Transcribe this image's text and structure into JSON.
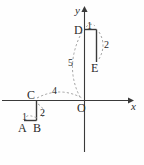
{
  "figure": {
    "kind": "coordinate-geometry-diagram",
    "background_color": "#fefefe",
    "stroke_color": "#3a3a3a",
    "dashed_color": "#8c8c8c",
    "axes": {
      "x_label": "x",
      "y_label": "y",
      "origin_label": "O",
      "origin_px": {
        "x": 84,
        "y": 100
      }
    },
    "points": [
      {
        "name": "A",
        "label": "A",
        "px": {
          "x": 24,
          "y": 120
        }
      },
      {
        "name": "B",
        "label": "B",
        "px": {
          "x": 36,
          "y": 120
        }
      },
      {
        "name": "C",
        "label": "C",
        "px": {
          "x": 36,
          "y": 100
        }
      },
      {
        "name": "D",
        "label": "D",
        "px": {
          "x": 84,
          "y": 29
        }
      },
      {
        "name": "E",
        "label": "E",
        "px": {
          "x": 96,
          "y": 62
        }
      }
    ],
    "segment_lengths": [
      {
        "id": "AB",
        "label": "1"
      },
      {
        "id": "BC",
        "label": "2"
      },
      {
        "id": "CO",
        "label": "4"
      },
      {
        "id": "DE_top",
        "label": "1"
      },
      {
        "id": "DE_side",
        "label": "2"
      },
      {
        "id": "OD",
        "label": "5"
      }
    ]
  }
}
